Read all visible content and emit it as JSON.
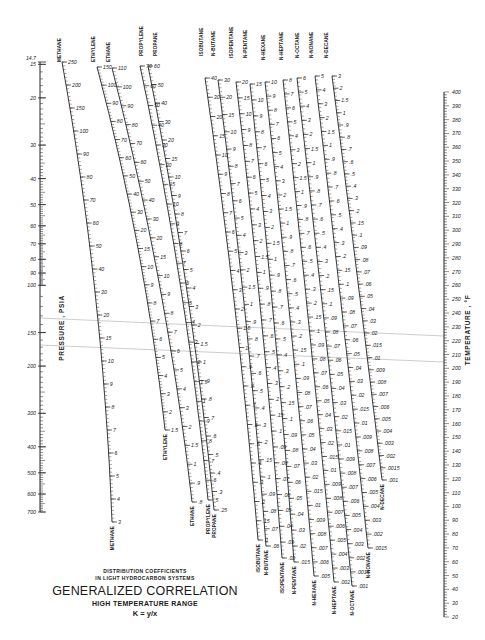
{
  "chart_data": {
    "type": "nomograph",
    "title": "GENERALIZED CORRELATION",
    "subtitle_lines": [
      "DISTRIBUTION COEFFICIENTS",
      "IN LIGHT HYDROCARBON SYSTEMS"
    ],
    "range_label": "HIGH TEMPERATURE RANGE",
    "equation": "K = y/x",
    "pressure_axis": {
      "label": "PRESSURE , PSIA",
      "ticks": [
        "14.7",
        "15",
        "20",
        "30",
        "40",
        "50",
        "60",
        "70",
        "80",
        "90",
        "100",
        "150",
        "200",
        "300",
        "400",
        "500",
        "600",
        "700"
      ],
      "values": [
        14.7,
        15,
        20,
        30,
        40,
        50,
        60,
        70,
        80,
        90,
        100,
        150,
        200,
        300,
        400,
        500,
        600,
        700
      ]
    },
    "temperature_axis": {
      "label": "TEMPERATURE , °F",
      "ticks": [
        "400",
        "390",
        "380",
        "370",
        "360",
        "350",
        "340",
        "330",
        "320",
        "310",
        "300",
        "290",
        "280",
        "270",
        "260",
        "250",
        "240",
        "230",
        "220",
        "210",
        "200",
        "190",
        "180",
        "170",
        "160",
        "150",
        "140",
        "130",
        "120",
        "110",
        "100",
        "90",
        "80",
        "70",
        "60",
        "50",
        "40",
        "30",
        "20"
      ]
    },
    "component_scales": [
      {
        "name": "METHANE",
        "range": [
          3,
          250
        ],
        "labels": [
          "250",
          "200",
          "150",
          "100",
          "90",
          "80",
          "70",
          "60",
          "50",
          "40",
          "30",
          "20",
          "15",
          "10",
          "9",
          "8",
          "7",
          "6",
          "5",
          "4",
          "3"
        ]
      },
      {
        "name": "ETHYLENE",
        "range": [
          1.5,
          150
        ],
        "labels": [
          "150",
          "100",
          "90",
          "80",
          "70",
          "60",
          "50",
          "40",
          "30",
          "20",
          "15",
          "10",
          "9",
          "8",
          "7",
          "6",
          "5",
          "4",
          "3",
          "2",
          "1.5"
        ]
      },
      {
        "name": "ETHANE",
        "range": [
          0.8,
          110
        ],
        "labels": [
          "110",
          "100",
          "90",
          "80",
          "70",
          "60",
          "50",
          "40",
          "30",
          "20",
          "15",
          "10",
          "9",
          "8",
          "7",
          "6",
          "5",
          "4",
          "3",
          "2",
          "1.5",
          "1",
          ".9",
          ".8"
        ]
      },
      {
        "name": "PROPYLENE",
        "range": [
          0.5,
          70
        ],
        "labels": [
          "70",
          "60",
          "50",
          "40",
          "30",
          "20",
          "15",
          "10",
          "9",
          "8",
          "7",
          "6",
          "5",
          "4",
          "3",
          "2",
          "1.5",
          "1",
          ".9",
          ".8",
          ".7",
          ".6",
          ".5"
        ]
      },
      {
        "name": "PROPANE",
        "range": [
          0.25,
          60
        ],
        "labels": [
          "60",
          "50",
          "40",
          "30",
          "20",
          "15",
          "10",
          "9",
          "8",
          "7",
          "6",
          "5",
          "4",
          "3",
          "2",
          "1.5",
          "1",
          ".9",
          ".8",
          ".7",
          ".6",
          ".5",
          ".4",
          ".3",
          ".25"
        ]
      },
      {
        "name": "ISOBUTANE",
        "range": [
          0.1,
          40
        ],
        "labels": [
          "40",
          "30",
          "20",
          "15",
          "10",
          "9",
          "8",
          "7",
          "6",
          "5",
          "4",
          "3",
          "2",
          "1.5",
          "1",
          ".9",
          ".8",
          ".7",
          ".6",
          ".5",
          ".4",
          ".3",
          ".2",
          ".15",
          ".1"
        ]
      },
      {
        "name": "N-BUTANE",
        "range": [
          0.06,
          30
        ],
        "labels": [
          "30",
          "20",
          "15",
          "10",
          "9",
          "8",
          "7",
          "6",
          "5",
          "4",
          "3",
          "2",
          "1.5",
          "1",
          ".9",
          ".8",
          ".7",
          ".6",
          ".5",
          ".4",
          ".3",
          ".2",
          ".15",
          ".1",
          ".09",
          ".08",
          ".07",
          ".06"
        ]
      },
      {
        "name": "ISOPENTANE",
        "range": [
          0.02,
          20
        ],
        "labels": [
          "20",
          "15",
          "10",
          "9",
          "8",
          "7",
          "6",
          "5",
          "4",
          "3",
          "2",
          "1.5",
          "1",
          ".9",
          ".8",
          ".7",
          ".6",
          ".5",
          ".4",
          ".3",
          ".2",
          ".15",
          ".1",
          ".09",
          ".08",
          ".07",
          ".06",
          ".05",
          ".04",
          ".03",
          ".02"
        ]
      },
      {
        "name": "N-PENTANE",
        "range": [
          0.015,
          15
        ],
        "labels": [
          "15",
          "10",
          "9",
          "8",
          "7",
          "6",
          "5",
          "4",
          "3",
          "2",
          "1.5",
          "1",
          ".9",
          ".8",
          ".7",
          ".6",
          ".5",
          ".4",
          ".3",
          ".2",
          ".15",
          ".1",
          ".09",
          ".08",
          ".07",
          ".06",
          ".05",
          ".04",
          ".03",
          ".02",
          ".015"
        ]
      },
      {
        "name": "N-HEXANE",
        "range": [
          0.005,
          10
        ],
        "labels": [
          "10",
          "9",
          "8",
          "7",
          "6",
          "5",
          "4",
          "3",
          "2",
          "1.5",
          "1",
          ".9",
          ".8",
          ".7",
          ".6",
          ".5",
          ".4",
          ".3",
          ".2",
          ".15",
          ".1",
          ".09",
          ".08",
          ".07",
          ".06",
          ".05",
          ".04",
          ".03",
          ".02",
          ".015",
          ".01",
          ".009",
          ".008",
          ".007",
          ".006",
          ".005"
        ]
      },
      {
        "name": "N-HEPTANE",
        "range": [
          0.002,
          8
        ],
        "labels": [
          "8",
          "7",
          "6",
          "5",
          "4",
          "3",
          "2",
          "1.5",
          "1",
          ".9",
          ".8",
          ".7",
          ".6",
          ".5",
          ".4",
          ".3",
          ".2",
          ".15",
          ".1",
          ".09",
          ".08",
          ".07",
          ".06",
          ".05",
          ".04",
          ".03",
          ".02",
          ".015",
          ".01",
          ".009",
          ".008",
          ".007",
          ".006",
          ".005",
          ".004",
          ".003",
          ".002"
        ]
      },
      {
        "name": "N-OCTANE",
        "range": [
          0.001,
          6
        ],
        "labels": [
          "6",
          "5",
          "4",
          "3",
          "2",
          "1.5",
          "1",
          ".9",
          ".8",
          ".7",
          ".6",
          ".5",
          ".4",
          ".3",
          ".2",
          ".15",
          ".1",
          ".09",
          ".08",
          ".07",
          ".06",
          ".05",
          ".04",
          ".03",
          ".02",
          ".015",
          ".01",
          ".009",
          ".008",
          ".007",
          ".006",
          ".005",
          ".004",
          ".003",
          ".002",
          ".0015",
          ".001"
        ]
      },
      {
        "name": "N-NONANE",
        "range": [
          0.0015,
          5
        ],
        "labels": [
          "5",
          "4",
          "3",
          "2",
          "1.5",
          "1",
          ".9",
          ".8",
          ".7",
          ".6",
          ".5",
          ".4",
          ".3",
          ".2",
          ".15",
          ".1",
          ".09",
          ".08",
          ".07",
          ".06",
          ".05",
          ".04",
          ".03",
          ".02",
          ".015",
          ".01",
          ".009",
          ".008",
          ".007",
          ".006",
          ".005",
          ".004",
          ".003",
          ".002",
          ".0015"
        ]
      },
      {
        "name": "N-DECANE",
        "range": [
          0.001,
          3
        ],
        "labels": [
          "3",
          "2",
          "1.5",
          "1",
          ".9",
          ".8",
          ".7",
          ".6",
          ".5",
          ".4",
          ".3",
          ".2",
          ".15",
          ".1",
          ".09",
          ".08",
          ".07",
          ".06",
          ".05",
          ".04",
          ".03",
          ".02",
          ".015",
          ".01",
          ".009",
          ".008",
          ".007",
          ".006",
          ".005",
          ".004",
          ".003",
          ".002",
          ".0015",
          ".001"
        ]
      }
    ],
    "reference_lines": [
      {
        "from_pressure": "~120 psia",
        "to_temperature": "~155 °F"
      },
      {
        "from_pressure": "~150 psia",
        "to_temperature": "~130 °F"
      }
    ]
  },
  "labels": {
    "subtitle_1": "DISTRIBUTION COEFFICIENTS",
    "subtitle_2": "IN LIGHT HYDROCARBON SYSTEMS",
    "title": "GENERALIZED CORRELATION",
    "range": "HIGH TEMPERATURE RANGE",
    "equation": "K = y/x",
    "pressure_axis": "PRESSURE , PSIA",
    "temperature_axis": "TEMPERATURE , °F"
  },
  "colors": {
    "ink": "#222222",
    "paper": "#ffffff",
    "reference_line": "#9a9a9a"
  }
}
